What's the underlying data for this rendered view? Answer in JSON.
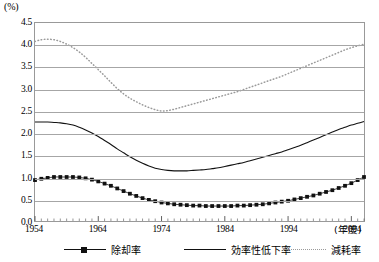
{
  "axes": {
    "y_unit_label": "(%)",
    "x_unit_label": "(年度)",
    "y_ticks": [
      "4.5",
      "4.0",
      "3.5",
      "3.0",
      "2.5",
      "2.0",
      "1.5",
      "1.0",
      "0.5",
      "0.0"
    ],
    "x_ticks": [
      "1954",
      "1964",
      "1974",
      "1984",
      "1994",
      "2004"
    ]
  },
  "legend": {
    "items": [
      {
        "label": "除却率",
        "style": "marker-line",
        "color": "#111111"
      },
      {
        "label": "効率性低下率",
        "style": "solid",
        "color": "#111111"
      },
      {
        "label": "減耗率",
        "style": "dotted",
        "color": "#9a9a9a"
      }
    ]
  },
  "chart_data": {
    "type": "line",
    "title": "",
    "xlabel": "(年度)",
    "ylabel": "(%)",
    "xlim": [
      1954,
      2006
    ],
    "ylim": [
      0.0,
      4.5
    ],
    "ytick_step": 0.5,
    "grid": true,
    "legend_position": "bottom",
    "x": [
      1954,
      1955,
      1956,
      1957,
      1958,
      1959,
      1960,
      1961,
      1962,
      1963,
      1964,
      1965,
      1966,
      1967,
      1968,
      1969,
      1970,
      1971,
      1972,
      1973,
      1974,
      1975,
      1976,
      1977,
      1978,
      1979,
      1980,
      1981,
      1982,
      1983,
      1984,
      1985,
      1986,
      1987,
      1988,
      1989,
      1990,
      1991,
      1992,
      1993,
      1994,
      1995,
      1996,
      1997,
      1998,
      1999,
      2000,
      2001,
      2002,
      2003,
      2004,
      2005,
      2006
    ],
    "series": [
      {
        "name": "除却率",
        "style": "marker-line",
        "color": "#111111",
        "values": [
          0.93,
          0.96,
          0.98,
          1.0,
          1.0,
          1.0,
          1.0,
          0.99,
          0.97,
          0.94,
          0.9,
          0.85,
          0.8,
          0.74,
          0.68,
          0.62,
          0.57,
          0.52,
          0.48,
          0.45,
          0.42,
          0.4,
          0.38,
          0.37,
          0.36,
          0.35,
          0.35,
          0.34,
          0.34,
          0.34,
          0.34,
          0.34,
          0.35,
          0.35,
          0.36,
          0.37,
          0.38,
          0.4,
          0.42,
          0.44,
          0.46,
          0.49,
          0.52,
          0.55,
          0.58,
          0.62,
          0.66,
          0.7,
          0.75,
          0.8,
          0.86,
          0.93,
          1.0
        ]
      },
      {
        "name": "効率性低下率",
        "style": "solid",
        "color": "#111111",
        "values": [
          2.25,
          2.25,
          2.25,
          2.24,
          2.23,
          2.21,
          2.18,
          2.13,
          2.07,
          2.0,
          1.92,
          1.83,
          1.74,
          1.64,
          1.55,
          1.46,
          1.38,
          1.31,
          1.25,
          1.2,
          1.17,
          1.15,
          1.14,
          1.14,
          1.14,
          1.15,
          1.16,
          1.17,
          1.19,
          1.21,
          1.24,
          1.27,
          1.3,
          1.33,
          1.37,
          1.41,
          1.45,
          1.49,
          1.53,
          1.57,
          1.62,
          1.67,
          1.72,
          1.78,
          1.84,
          1.9,
          1.96,
          2.02,
          2.08,
          2.13,
          2.18,
          2.22,
          2.26
        ]
      },
      {
        "name": "減耗率",
        "style": "dotted",
        "color": "#9a9a9a",
        "values": [
          4.08,
          4.12,
          4.13,
          4.12,
          4.08,
          4.02,
          3.94,
          3.84,
          3.72,
          3.58,
          3.44,
          3.3,
          3.15,
          3.01,
          2.89,
          2.79,
          2.71,
          2.64,
          2.58,
          2.53,
          2.5,
          2.51,
          2.54,
          2.58,
          2.62,
          2.66,
          2.7,
          2.74,
          2.78,
          2.82,
          2.86,
          2.9,
          2.94,
          2.99,
          3.04,
          3.09,
          3.14,
          3.19,
          3.24,
          3.29,
          3.35,
          3.41,
          3.47,
          3.53,
          3.59,
          3.65,
          3.71,
          3.77,
          3.83,
          3.89,
          3.94,
          3.98,
          4.02
        ]
      }
    ]
  }
}
